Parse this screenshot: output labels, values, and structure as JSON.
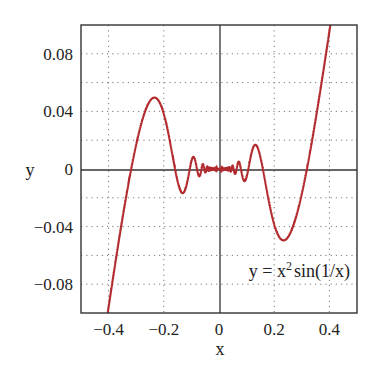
{
  "chart_data": {
    "type": "line",
    "title": "",
    "xlabel": "x",
    "ylabel": "y",
    "xlim": [
      -0.5,
      0.5
    ],
    "ylim": [
      -0.1,
      0.1
    ],
    "grid": true,
    "grid_style": "dotted",
    "xticks": [
      -0.4,
      -0.2,
      0,
      0.2,
      0.4
    ],
    "xtick_labels": [
      "−0.4",
      "−0.2",
      "0",
      "0.2",
      "0.4"
    ],
    "yticks": [
      0.08,
      0.04,
      0,
      -0.04,
      -0.08
    ],
    "ytick_labels": [
      "0.08",
      "0.04",
      "0",
      "−0.04",
      "−0.08"
    ],
    "minor_grid_y": [
      0.06,
      0.02,
      -0.02,
      -0.06
    ],
    "series": [
      {
        "name": "y = x^2 sin(1/x)",
        "function": "x^2*sin(1/x)",
        "color": "#b22a2e",
        "x_range": [
          -0.5,
          0.5
        ]
      }
    ],
    "annotation": {
      "text_main": "y = x",
      "text_sup": "2",
      "text_tail": "sin(1/x)",
      "position": "lower right"
    }
  }
}
